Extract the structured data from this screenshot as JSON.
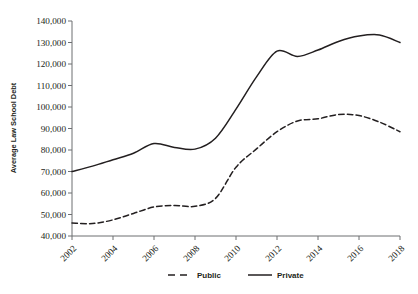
{
  "chart_data": {
    "type": "line",
    "title": "",
    "xlabel": "",
    "ylabel": "Average Law School Debt",
    "xlim": [
      2002,
      2018
    ],
    "ylim": [
      40000,
      140000
    ],
    "grid": false,
    "legend_position": "bottom-center",
    "x": [
      2002,
      2003,
      2004,
      2005,
      2006,
      2007,
      2008,
      2009,
      2010,
      2011,
      2012,
      2013,
      2014,
      2015,
      2016,
      2017,
      2018
    ],
    "xticks": [
      2002,
      2004,
      2006,
      2008,
      2010,
      2012,
      2014,
      2016,
      2018
    ],
    "xtick_labels": [
      "2002",
      "2004",
      "2006",
      "2008",
      "2010",
      "2012",
      "2014",
      "2016",
      "2018"
    ],
    "yticks": [
      40000,
      50000,
      60000,
      70000,
      80000,
      90000,
      100000,
      110000,
      120000,
      130000,
      140000
    ],
    "ytick_labels": [
      "40,000",
      "50,000",
      "60,000",
      "70,000",
      "80,000",
      "90,000",
      "100,000",
      "110,000",
      "120,000",
      "130,000",
      "140,000"
    ],
    "series": [
      {
        "name": "Public",
        "style": "dashed",
        "color": "#231f20",
        "values": [
          46000,
          45800,
          47500,
          50500,
          53500,
          54200,
          53800,
          57500,
          72000,
          80500,
          88500,
          93500,
          94500,
          96500,
          96000,
          93000,
          88500
        ]
      },
      {
        "name": "Private",
        "style": "solid",
        "color": "#231f20",
        "values": [
          70000,
          72500,
          75500,
          78500,
          83000,
          81200,
          80400,
          85500,
          99000,
          114000,
          126000,
          123500,
          126500,
          130500,
          133000,
          133500,
          130000
        ]
      }
    ]
  },
  "legend": {
    "items": [
      {
        "label": "Public",
        "style": "dashed"
      },
      {
        "label": "Private",
        "style": "solid"
      }
    ]
  },
  "axes": {
    "y_title": "Average Law School Debt"
  }
}
